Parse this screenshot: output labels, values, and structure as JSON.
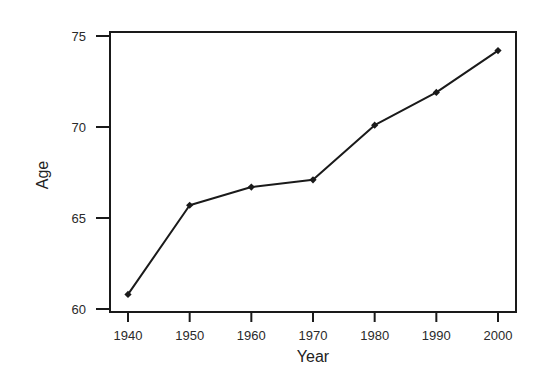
{
  "chart_data": {
    "type": "line",
    "title": "",
    "xlabel": "Year",
    "ylabel": "Age",
    "x": [
      1940,
      1950,
      1960,
      1970,
      1980,
      1990,
      2000
    ],
    "series": [
      {
        "name": "Age",
        "values": [
          60.8,
          65.7,
          66.7,
          67.1,
          70.1,
          71.9,
          74.2
        ],
        "marker": "diamond",
        "color": "#1a1a1a"
      }
    ],
    "x_ticks": [
      "1940",
      "1950",
      "1960",
      "1970",
      "1980",
      "1990",
      "2000"
    ],
    "y_ticks": [
      "60",
      "65",
      "70",
      "75"
    ],
    "xlim": [
      1940,
      2000
    ],
    "ylim": [
      60,
      75
    ],
    "grid": false,
    "legend": null
  },
  "colors": {
    "line": "#1a1a1a",
    "frame": "#1a1a1a",
    "background": "#ffffff"
  }
}
